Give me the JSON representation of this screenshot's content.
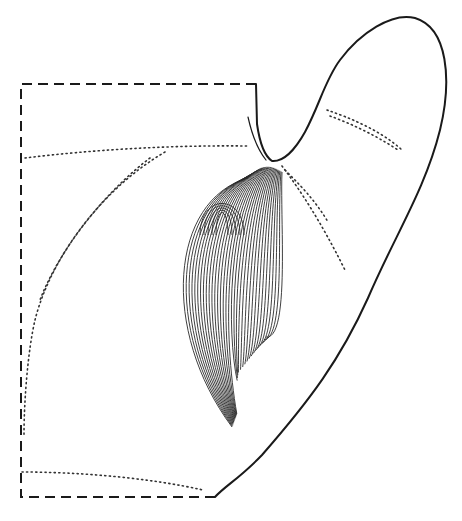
{
  "figure": {
    "colors": {
      "background": "#ffffff",
      "ink": "#1a1a1a"
    },
    "fiber_count": 34
  }
}
